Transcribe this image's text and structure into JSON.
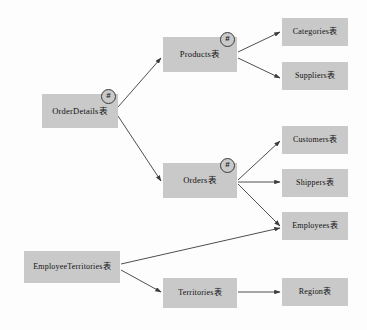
{
  "diagram": {
    "background_color": "#fdfdfd",
    "node_fill_color": "#c9c9c9",
    "edge_color": "#3a3a3a",
    "badge_symbol": "#",
    "nodes": [
      {
        "id": "order-details",
        "label": "OrderDetails表",
        "x": 42,
        "y": 94,
        "w": 76,
        "h": 34,
        "font_size": 8.5,
        "badge": "#",
        "badge_x": 101,
        "badge_y": 89
      },
      {
        "id": "products",
        "label": "Products表",
        "x": 163,
        "y": 37,
        "w": 74,
        "h": 35,
        "font_size": 8.5,
        "badge": "#",
        "badge_x": 220,
        "badge_y": 32
      },
      {
        "id": "orders",
        "label": "Orders表",
        "x": 163,
        "y": 163,
        "w": 74,
        "h": 35,
        "font_size": 8.5,
        "badge": "#",
        "badge_x": 220,
        "badge_y": 158
      },
      {
        "id": "categories",
        "label": "Categories表",
        "x": 282,
        "y": 18,
        "w": 66,
        "h": 28,
        "font_size": 8,
        "badge": null,
        "badge_x": 0,
        "badge_y": 0
      },
      {
        "id": "suppliers",
        "label": "Suppliers表",
        "x": 282,
        "y": 62,
        "w": 66,
        "h": 28,
        "font_size": 8,
        "badge": null,
        "badge_x": 0,
        "badge_y": 0
      },
      {
        "id": "customers",
        "label": "Customers表",
        "x": 282,
        "y": 126,
        "w": 66,
        "h": 28,
        "font_size": 8,
        "badge": null,
        "badge_x": 0,
        "badge_y": 0
      },
      {
        "id": "shippers",
        "label": "Shippers表",
        "x": 282,
        "y": 169,
        "w": 66,
        "h": 28,
        "font_size": 8,
        "badge": null,
        "badge_x": 0,
        "badge_y": 0
      },
      {
        "id": "employees",
        "label": "Employees表",
        "x": 282,
        "y": 212,
        "w": 66,
        "h": 28,
        "font_size": 8,
        "badge": null,
        "badge_x": 0,
        "badge_y": 0
      },
      {
        "id": "region",
        "label": "Region表",
        "x": 282,
        "y": 278,
        "w": 66,
        "h": 28,
        "font_size": 8,
        "badge": null,
        "badge_x": 0,
        "badge_y": 0
      },
      {
        "id": "employee-territories",
        "label": "EmployeeTerritories表",
        "x": 24,
        "y": 251,
        "w": 96,
        "h": 32,
        "font_size": 8,
        "badge": null,
        "badge_x": 0,
        "badge_y": 0
      },
      {
        "id": "territories",
        "label": "Territories表",
        "x": 163,
        "y": 278,
        "w": 74,
        "h": 30,
        "font_size": 8,
        "badge": null,
        "badge_x": 0,
        "badge_y": 0
      }
    ],
    "edges": [
      {
        "id": "order-details-to-products",
        "from": "OrderDetails表",
        "to": "Products表",
        "x1": 118,
        "y1": 107,
        "x2": 161,
        "y2": 58
      },
      {
        "id": "order-details-to-orders",
        "from": "OrderDetails表",
        "to": "Orders表",
        "x1": 118,
        "y1": 116,
        "x2": 161,
        "y2": 181
      },
      {
        "id": "products-to-categories",
        "from": "Products表",
        "to": "Categories表",
        "x1": 238,
        "y1": 52,
        "x2": 280,
        "y2": 32
      },
      {
        "id": "products-to-suppliers",
        "from": "Products表",
        "to": "Suppliers表",
        "x1": 238,
        "y1": 58,
        "x2": 280,
        "y2": 78
      },
      {
        "id": "orders-to-customers",
        "from": "Orders表",
        "to": "Customers表",
        "x1": 238,
        "y1": 180,
        "x2": 280,
        "y2": 141
      },
      {
        "id": "orders-to-shippers",
        "from": "Orders表",
        "to": "Shippers表",
        "x1": 238,
        "y1": 182,
        "x2": 280,
        "y2": 182
      },
      {
        "id": "orders-to-employees",
        "from": "Orders表",
        "to": "Employees表",
        "x1": 238,
        "y1": 184,
        "x2": 280,
        "y2": 226
      },
      {
        "id": "employee-territories-to-employees",
        "from": "EmployeeTerritories表",
        "to": "Employees表",
        "x1": 121,
        "y1": 264,
        "x2": 280,
        "y2": 228
      },
      {
        "id": "employee-territories-to-territories",
        "from": "EmployeeTerritories表",
        "to": "Territories表",
        "x1": 121,
        "y1": 270,
        "x2": 161,
        "y2": 292
      },
      {
        "id": "territories-to-region",
        "from": "Territories表",
        "to": "Region表",
        "x1": 238,
        "y1": 292,
        "x2": 280,
        "y2": 292
      }
    ]
  }
}
